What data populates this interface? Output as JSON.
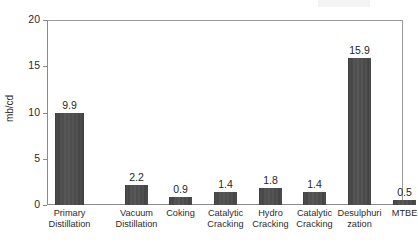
{
  "chart_data": {
    "type": "bar",
    "title": "",
    "subtitle": "",
    "xlabel": "",
    "ylabel": "mb/cd",
    "ylim": [
      0,
      20
    ],
    "yticks": [
      0,
      5,
      10,
      15,
      20
    ],
    "ytick_labels": [
      "0",
      "5",
      "10",
      "15",
      "20"
    ],
    "grid": false,
    "legend": "none",
    "bar_color": "#4a4a4a",
    "categories": [
      "Primary Distillation",
      "Vacuum Distillation",
      "Coking",
      "Catalytic Cracking",
      "Hydro Cracking",
      "Catalytic Cracking",
      "Desulphurization",
      "MTBE"
    ],
    "category_lines": [
      [
        "Primary",
        "Distillation"
      ],
      [
        "Vacuum",
        "Distillation"
      ],
      [
        "Coking",
        ""
      ],
      [
        "Catalytic",
        "Cracking"
      ],
      [
        "Hydro",
        "Cracking"
      ],
      [
        "Catalytic",
        "Cracking"
      ],
      [
        "Desulphuri",
        "zation"
      ],
      [
        "MTBE",
        ""
      ]
    ],
    "values": [
      9.9,
      2.2,
      0.9,
      1.4,
      1.8,
      1.4,
      15.9,
      0.5
    ],
    "value_labels": [
      "9.9",
      "2.2",
      "0.9",
      "1.4",
      "1.8",
      "1.4",
      "15.9",
      "0.5"
    ]
  }
}
